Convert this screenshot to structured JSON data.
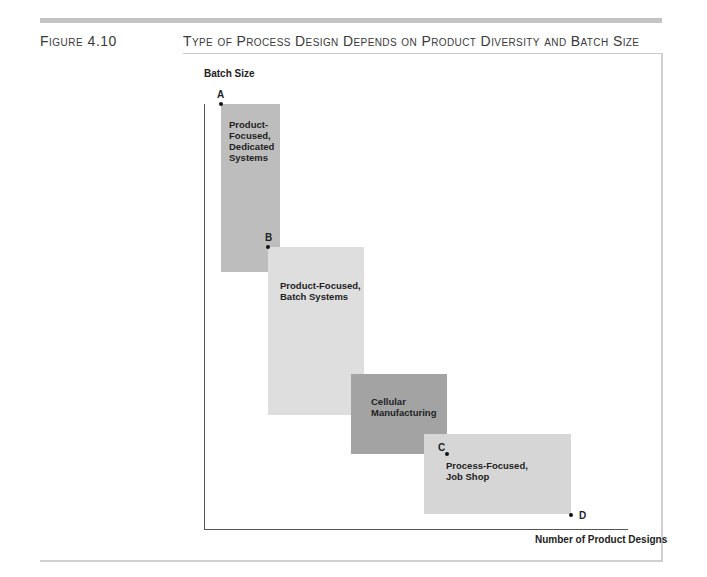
{
  "figure": {
    "label": "Figure 4.10",
    "title": "Type of Process Design Depends on Product Diversity and Batch Size"
  },
  "axes": {
    "ylabel": "Batch Size",
    "xlabel": "Number of Product Designs"
  },
  "regions": [
    {
      "label": "Product-\nFocused,\nDedicated\nSystems",
      "color": "#bdbdbd"
    },
    {
      "label": "Product-Focused,\nBatch Systems",
      "color": "#dedede"
    },
    {
      "label": "Cellular\nManufacturing",
      "color": "#a3a3a3"
    },
    {
      "label": "Process-Focused,\nJob Shop",
      "color": "#d6d6d6"
    }
  ],
  "points": [
    {
      "label": "A"
    },
    {
      "label": "B"
    },
    {
      "label": "C"
    },
    {
      "label": "D"
    }
  ]
}
